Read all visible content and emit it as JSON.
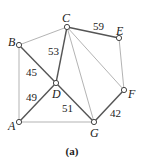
{
  "caption": "(a)",
  "colors": {
    "heavy_edge": "#555555",
    "light_edge": "#aaaaaa",
    "node_fill": "#ffffff",
    "node_stroke": "#444444"
  },
  "nodes": [
    {
      "id": "A",
      "label": "A",
      "x": 19,
      "y": 122,
      "lx": 8,
      "ly": 130
    },
    {
      "id": "B",
      "label": "B",
      "x": 19,
      "y": 45,
      "lx": 8,
      "ly": 46
    },
    {
      "id": "C",
      "label": "C",
      "x": 67,
      "y": 27,
      "lx": 62,
      "ly": 22
    },
    {
      "id": "D",
      "label": "D",
      "x": 56,
      "y": 83,
      "lx": 52,
      "ly": 98
    },
    {
      "id": "E",
      "label": "E",
      "x": 119,
      "y": 38,
      "lx": 116,
      "ly": 35
    },
    {
      "id": "F",
      "label": "F",
      "x": 124,
      "y": 90,
      "lx": 128,
      "ly": 98
    },
    {
      "id": "G",
      "label": "G",
      "x": 94,
      "y": 122,
      "lx": 90,
      "ly": 137
    }
  ],
  "edges": [
    {
      "from": "C",
      "to": "E",
      "weight": "59",
      "heavy": true,
      "wx": 93,
      "wy": 30
    },
    {
      "from": "C",
      "to": "D",
      "weight": "53",
      "heavy": true,
      "wx": 48,
      "wy": 55
    },
    {
      "from": "B",
      "to": "D",
      "weight": "45",
      "heavy": true,
      "wx": 26,
      "wy": 76
    },
    {
      "from": "A",
      "to": "D",
      "weight": "49",
      "heavy": true,
      "wx": 26,
      "wy": 101
    },
    {
      "from": "D",
      "to": "G",
      "weight": "51",
      "heavy": true,
      "wx": 62,
      "wy": 112
    },
    {
      "from": "G",
      "to": "F",
      "weight": "42",
      "heavy": true,
      "wx": 110,
      "wy": 117
    },
    {
      "from": "B",
      "to": "C",
      "weight": "",
      "heavy": false
    },
    {
      "from": "B",
      "to": "A",
      "weight": "",
      "heavy": false
    },
    {
      "from": "A",
      "to": "G",
      "weight": "",
      "heavy": false
    },
    {
      "from": "C",
      "to": "G",
      "weight": "",
      "heavy": false
    },
    {
      "from": "C",
      "to": "F",
      "weight": "",
      "heavy": false
    },
    {
      "from": "E",
      "to": "F",
      "weight": "",
      "heavy": false
    }
  ]
}
